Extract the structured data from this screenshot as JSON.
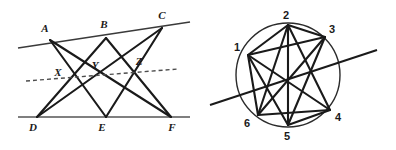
{
  "figure": {
    "background_color": "#ffffff",
    "stroke_color": "#1a1a1a",
    "line_color": "#555555",
    "dash_color": "#4d4d4d",
    "width": 396,
    "height": 150
  },
  "left_figure": {
    "name": "pappus-configuration",
    "top_line": {
      "label": "line-ABC",
      "x1": 18,
      "y1": 48,
      "x2": 190,
      "y2": 22
    },
    "bottom_line": {
      "label": "line-DEF",
      "x1": 18,
      "y1": 117,
      "x2": 190,
      "y2": 117
    },
    "dashed_line": {
      "label": "pappus-line-XYZ",
      "x1": 26,
      "y1": 81,
      "x2": 178,
      "y2": 69
    },
    "vertices": [
      {
        "id": "A",
        "label": "A",
        "x": 50,
        "y": 40,
        "label_x": 45,
        "label_y": 32
      },
      {
        "id": "B",
        "label": "B",
        "x": 106,
        "y": 38,
        "label_x": 104,
        "label_y": 28
      },
      {
        "id": "C",
        "label": "C",
        "x": 162,
        "y": 28,
        "label_x": 162,
        "label_y": 19
      },
      {
        "id": "D",
        "label": "D",
        "x": 37,
        "y": 117,
        "label_x": 33,
        "label_y": 131
      },
      {
        "id": "E",
        "label": "E",
        "x": 106,
        "y": 117,
        "label_x": 102,
        "label_y": 131
      },
      {
        "id": "F",
        "label": "F",
        "x": 171,
        "y": 117,
        "label_x": 170,
        "label_y": 131
      }
    ],
    "intersections": [
      {
        "id": "X",
        "label": "X",
        "x": 70,
        "y": 78,
        "label_x": 58,
        "label_y": 76
      },
      {
        "id": "Y",
        "label": "Y",
        "x": 97,
        "y": 76,
        "label_x": 95,
        "label_y": 69
      },
      {
        "id": "Z",
        "label": "Z",
        "x": 138,
        "y": 72,
        "label_x": 138,
        "label_y": 65
      }
    ],
    "segments": [
      {
        "name": "segment-A-E",
        "from": "A",
        "to": "E",
        "x1": 50,
        "y1": 40,
        "x2": 106,
        "y2": 117
      },
      {
        "name": "segment-A-F",
        "from": "A",
        "to": "F",
        "x1": 50,
        "y1": 40,
        "x2": 171,
        "y2": 117
      },
      {
        "name": "segment-B-D",
        "from": "B",
        "to": "D",
        "x1": 106,
        "y1": 38,
        "x2": 37,
        "y2": 117
      },
      {
        "name": "segment-B-F",
        "from": "B",
        "to": "F",
        "x1": 106,
        "y1": 38,
        "x2": 171,
        "y2": 117
      },
      {
        "name": "segment-C-D",
        "from": "C",
        "to": "D",
        "x1": 162,
        "y1": 28,
        "x2": 37,
        "y2": 117
      },
      {
        "name": "segment-C-E",
        "from": "C",
        "to": "E",
        "x1": 162,
        "y1": 28,
        "x2": 106,
        "y2": 117
      }
    ]
  },
  "right_figure": {
    "name": "cyclic-hexagram-configuration",
    "circle": {
      "label": "circumscribing-circle",
      "cx": 288,
      "cy": 75,
      "r": 52
    },
    "pascal_line": {
      "label": "pascal-line",
      "x1": 210,
      "y1": 105,
      "x2": 377,
      "y2": 50
    },
    "vertices": [
      {
        "id": "1",
        "label": "1",
        "x": 248,
        "y": 55,
        "label_x": 236,
        "label_y": 50
      },
      {
        "id": "2",
        "label": "2",
        "x": 288,
        "y": 25,
        "label_x": 284,
        "label_y": 18
      },
      {
        "id": "3",
        "label": "3",
        "x": 325,
        "y": 37,
        "label_x": 330,
        "label_y": 32
      },
      {
        "id": "4",
        "label": "4",
        "x": 330,
        "y": 110,
        "label_x": 335,
        "label_y": 120
      },
      {
        "id": "5",
        "label": "5",
        "x": 288,
        "y": 125,
        "label_x": 284,
        "label_y": 139
      },
      {
        "id": "6",
        "label": "6",
        "x": 258,
        "y": 115,
        "label_x": 246,
        "label_y": 125
      }
    ],
    "segments": [
      {
        "name": "segment-1-2",
        "from": "1",
        "to": "2",
        "x1": 248,
        "y1": 55,
        "x2": 288,
        "y2": 25
      },
      {
        "name": "segment-2-3",
        "from": "2",
        "to": "3",
        "x1": 288,
        "y1": 25,
        "x2": 325,
        "y2": 37
      },
      {
        "name": "segment-3-4",
        "from": "3",
        "to": "4",
        "x1": 325,
        "y1": 37,
        "x2": 330,
        "y2": 110
      },
      {
        "name": "segment-4-5",
        "from": "4",
        "to": "5",
        "x1": 330,
        "y1": 110,
        "x2": 288,
        "y2": 125
      },
      {
        "name": "segment-5-6",
        "from": "5",
        "to": "6",
        "x1": 288,
        "y1": 125,
        "x2": 258,
        "y2": 115
      },
      {
        "name": "segment-6-1",
        "from": "6",
        "to": "1",
        "x1": 258,
        "y1": 115,
        "x2": 248,
        "y2": 55
      },
      {
        "name": "segment-1-4",
        "from": "1",
        "to": "4",
        "x1": 248,
        "y1": 55,
        "x2": 330,
        "y2": 110
      },
      {
        "name": "segment-2-5",
        "from": "2",
        "to": "5",
        "x1": 288,
        "y1": 25,
        "x2": 288,
        "y2": 125
      },
      {
        "name": "segment-3-6",
        "from": "3",
        "to": "6",
        "x1": 325,
        "y1": 37,
        "x2": 258,
        "y2": 115
      },
      {
        "name": "segment-1-3",
        "from": "1",
        "to": "3",
        "x1": 248,
        "y1": 55,
        "x2": 325,
        "y2": 37
      },
      {
        "name": "segment-2-6",
        "from": "2",
        "to": "6",
        "x1": 288,
        "y1": 25,
        "x2": 258,
        "y2": 115
      },
      {
        "name": "segment-3-5",
        "from": "3",
        "to": "5",
        "x1": 325,
        "y1": 37,
        "x2": 288,
        "y2": 125
      },
      {
        "name": "segment-4-6",
        "from": "4",
        "to": "6",
        "x1": 330,
        "y1": 110,
        "x2": 258,
        "y2": 115
      },
      {
        "name": "segment-2-4",
        "from": "2",
        "to": "4",
        "x1": 288,
        "y1": 25,
        "x2": 330,
        "y2": 110
      },
      {
        "name": "segment-1-5",
        "from": "1",
        "to": "5",
        "x1": 248,
        "y1": 55,
        "x2": 288,
        "y2": 125
      }
    ]
  }
}
